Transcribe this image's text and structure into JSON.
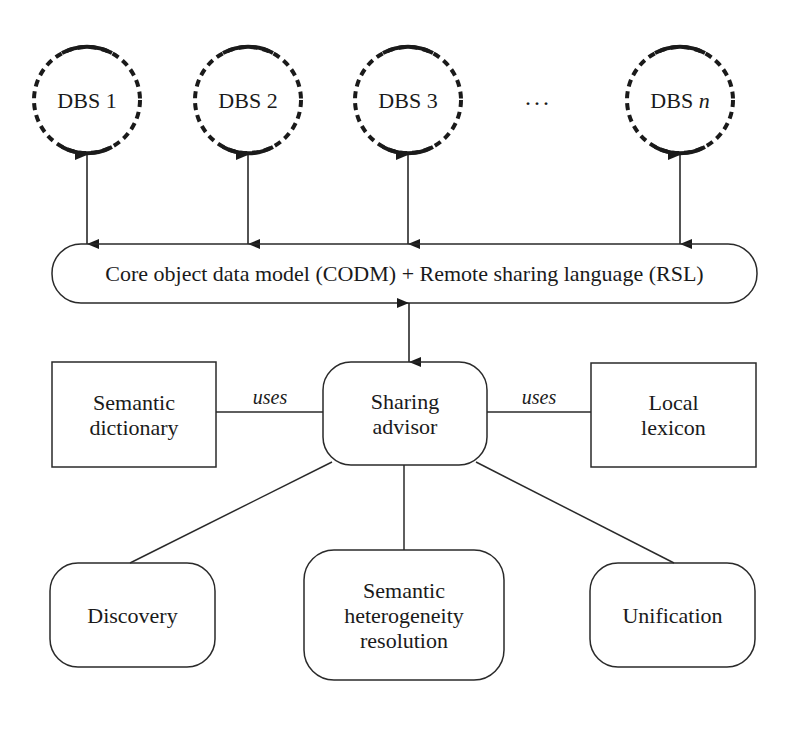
{
  "diagram": {
    "type": "architecture",
    "databases": [
      {
        "id": "dbs1",
        "label_prefix": "DBS",
        "label_suffix": "1"
      },
      {
        "id": "dbs2",
        "label_prefix": "DBS",
        "label_suffix": "2"
      },
      {
        "id": "dbs3",
        "label_prefix": "DBS",
        "label_suffix": "3"
      },
      {
        "id": "dbsn",
        "label_prefix": "DBS",
        "label_suffix": "n"
      }
    ],
    "ellipsis": "...",
    "core_layer": {
      "label": "Core object data model (CODM) + Remote sharing language (RSL)"
    },
    "sharing_advisor": {
      "label": "Sharing\nadvisor"
    },
    "resources": [
      {
        "id": "semantic-dictionary",
        "label": "Semantic\ndictionary",
        "relation": "uses"
      },
      {
        "id": "local-lexicon",
        "label": "Local\nlexicon",
        "relation": "uses"
      }
    ],
    "functions": [
      {
        "id": "discovery",
        "label": "Discovery"
      },
      {
        "id": "semantic-heterogeneity-resolution",
        "label": "Semantic\nheterogeneity\nresolution"
      },
      {
        "id": "unification",
        "label": "Unification"
      }
    ],
    "edges": [
      {
        "from": "DBS 1",
        "to": "CODM+RSL",
        "type": "bidirectional-arrow"
      },
      {
        "from": "DBS 2",
        "to": "CODM+RSL",
        "type": "bidirectional-arrow"
      },
      {
        "from": "DBS 3",
        "to": "CODM+RSL",
        "type": "bidirectional-arrow"
      },
      {
        "from": "DBS n",
        "to": "CODM+RSL",
        "type": "bidirectional-arrow"
      },
      {
        "from": "CODM+RSL",
        "to": "Sharing advisor",
        "type": "bidirectional-arrow"
      },
      {
        "from": "Sharing advisor",
        "to": "Semantic dictionary",
        "type": "line",
        "label": "uses"
      },
      {
        "from": "Sharing advisor",
        "to": "Local lexicon",
        "type": "line",
        "label": "uses"
      },
      {
        "from": "Sharing advisor",
        "to": "Discovery",
        "type": "line"
      },
      {
        "from": "Sharing advisor",
        "to": "Semantic heterogeneity resolution",
        "type": "line"
      },
      {
        "from": "Sharing advisor",
        "to": "Unification",
        "type": "line"
      }
    ],
    "colors": {
      "stroke": "#2a2a2a",
      "background": "#ffffff"
    }
  }
}
